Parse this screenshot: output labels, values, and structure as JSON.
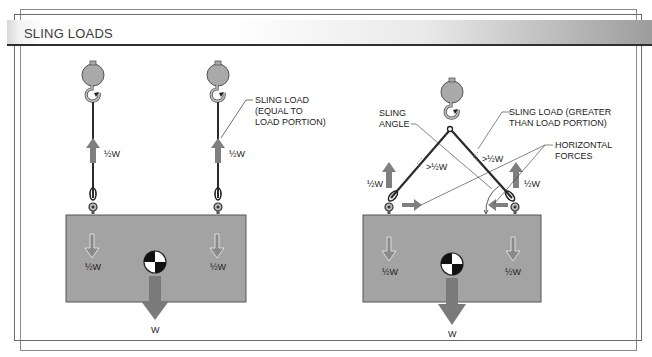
{
  "header": {
    "title": "SLING LOADS"
  },
  "left_diagram": {
    "sling_label_1": "½W",
    "sling_label_2": "½W",
    "callout_line1": "SLING LOAD",
    "callout_line2": "(EQUAL TO",
    "callout_line3": "LOAD PORTION)",
    "load_portion_left": "½W",
    "load_portion_right": "½W",
    "total_weight": "W"
  },
  "right_diagram": {
    "sling_angle_line1": "SLING",
    "sling_angle_line2": "ANGLE",
    "sling_load_line1": "SLING LOAD (GREATER",
    "sling_load_line2": "THAN LOAD PORTION)",
    "horizontal_line1": "HORIZONTAL",
    "horizontal_line2": "FORCES",
    "sling_tension_left": ">½W",
    "sling_tension_right": ">½W",
    "vertical_left": "½W",
    "vertical_right": "½W",
    "load_portion_left": "½W",
    "load_portion_right": "½W",
    "total_weight": "W"
  },
  "colors": {
    "load_block": "#a3a3a3",
    "arrow": "#7f7f7f",
    "ball": "#a9a9a9",
    "sling": "#2b2b2b"
  }
}
